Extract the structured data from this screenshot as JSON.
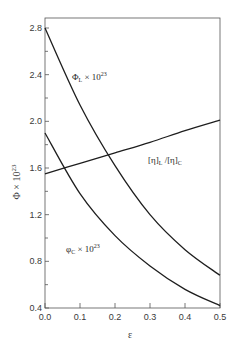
{
  "chart_data": {
    "type": "line",
    "title": "",
    "xlabel": "ε",
    "ylabel": "Φ × 10^23",
    "xlim": [
      0.0,
      0.5
    ],
    "ylim": [
      0.4,
      2.8
    ],
    "x_ticks": [
      "0.0",
      "0.1",
      "0.2",
      "0.3",
      "0.4",
      "0.5"
    ],
    "y_ticks": [
      "0.4",
      "0.8",
      "1.2",
      "1.6",
      "2.0",
      "2.4",
      "2.8"
    ],
    "grid": false,
    "legend": "none (inline curve labels)",
    "x": [
      0.0,
      0.1,
      0.2,
      0.3,
      0.4,
      0.5
    ],
    "series": [
      {
        "name": "Φ_L × 10^23",
        "label": "Φ",
        "label_sub": "L",
        "label_rest": " × 10",
        "label_sup": "23",
        "values": [
          2.8,
          2.14,
          1.62,
          1.2,
          0.9,
          0.68
        ]
      },
      {
        "name": "φ_C × 10^23",
        "label": "φ",
        "label_sub": "C",
        "label_rest": " × 10",
        "label_sup": "23",
        "values": [
          1.9,
          1.38,
          1.02,
          0.76,
          0.56,
          0.42
        ]
      },
      {
        "name": "[η]_L / [η]_C",
        "label": "[η]",
        "label_sub": "L",
        "label_rest": " /[η]",
        "label_sub2": "C",
        "values": [
          1.55,
          1.64,
          1.73,
          1.82,
          1.92,
          2.01
        ]
      }
    ],
    "annotations": [
      "Φ_L × 10^23",
      "φ_C × 10^23",
      "[η]_L/[η]_C"
    ]
  }
}
